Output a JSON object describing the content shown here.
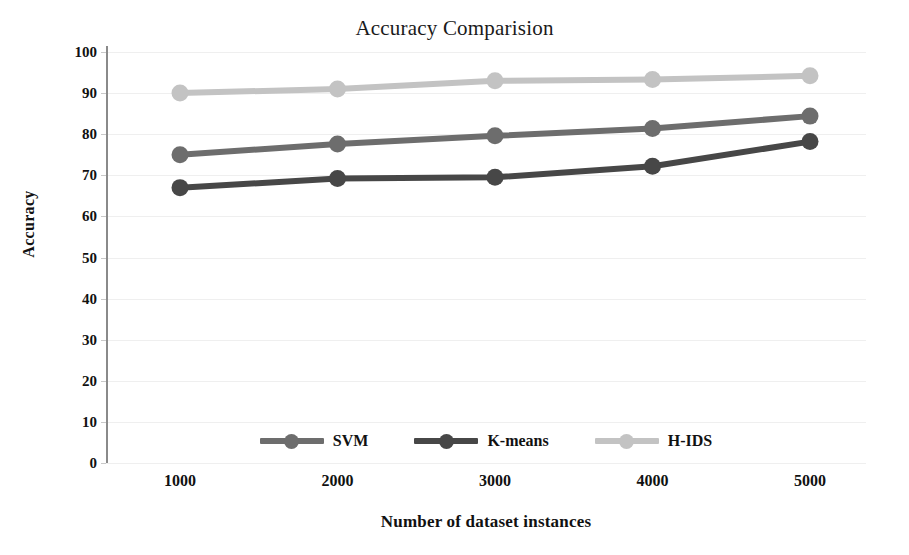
{
  "chart_data": {
    "type": "line",
    "title": "Accuracy Comparision",
    "xlabel": "Number of dataset instances",
    "ylabel": "Accuracy",
    "categories": [
      "1000",
      "2000",
      "3000",
      "4000",
      "5000"
    ],
    "x": [
      1000,
      2000,
      3000,
      4000,
      5000
    ],
    "xlim": [
      1000,
      5000
    ],
    "ylim": [
      0,
      100
    ],
    "yticks": [
      0,
      10,
      20,
      30,
      40,
      50,
      60,
      70,
      80,
      90,
      100
    ],
    "ytick_labels": [
      "0",
      "10",
      "20",
      "30",
      "40",
      "50",
      "60",
      "70",
      "80",
      "90",
      "100"
    ],
    "grid": true,
    "legend_position": "bottom",
    "markers": "circle",
    "series": [
      {
        "name": "SVM",
        "color": "#6d6d6d",
        "values": [
          75.0,
          77.6,
          79.6,
          81.4,
          84.4
        ]
      },
      {
        "name": "K-means",
        "color": "#474747",
        "values": [
          67.0,
          69.2,
          69.5,
          72.2,
          78.2
        ]
      },
      {
        "name": "H-IDS",
        "color": "#c3c3c3",
        "values": [
          90.0,
          91.0,
          93.0,
          93.3,
          94.2
        ]
      }
    ]
  },
  "colors": {
    "background": "#ffffff",
    "axis": "#8a8a8a",
    "gridline": "#efefef",
    "text": "#111111",
    "title_text": "#1a1a1a"
  }
}
